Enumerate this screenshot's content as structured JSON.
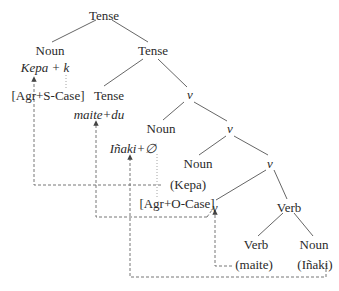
{
  "diagram": {
    "type": "syntax-tree",
    "nodes": {
      "root_tense": "Tense",
      "noun_subject": "Noun",
      "tense_bar": "Tense",
      "kepa_k": "Kepa + k",
      "agr_s_case": "[Agr+S-Case]",
      "tense_head": "Tense",
      "v_phrase": "v",
      "maite_du": "maite+du",
      "noun_object": "Noun",
      "v_bar": "v",
      "inaki_null": "Iñaki+∅",
      "noun_kepa": "Noun",
      "v_bar2": "v",
      "kepa_trace": "(Kepa)",
      "agr_o_case": "[Agr+O-Case]",
      "v_head": "v",
      "verb_phrase": "Verb",
      "verb_head": "Verb",
      "noun_inaki": "Noun",
      "maite_trace": "(maite)",
      "inaki_trace": "(Iñaki)"
    },
    "colors": {
      "text": "#2a2a2a",
      "branch": "#555555",
      "dashed": "#666666",
      "dotted": "#999999"
    }
  }
}
